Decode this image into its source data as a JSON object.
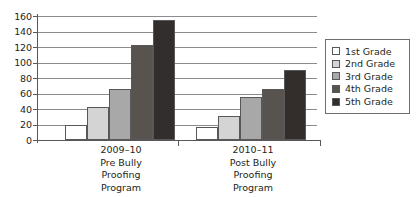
{
  "chart_data": {
    "type": "bar",
    "title": "",
    "subtitle": "",
    "xlabel": "",
    "ylabel": "",
    "ylim": [
      0,
      160
    ],
    "ytick_labels": [
      "160",
      "140",
      "120",
      "100",
      "80",
      "60",
      "40",
      "20",
      "0"
    ],
    "ytick_values": [
      160,
      140,
      120,
      100,
      80,
      60,
      40,
      20,
      0
    ],
    "grid": true,
    "legend_position": "right",
    "categories": [
      "2009–10 Pre Bully Proofing Program",
      "2010–11 Post Bully Proofing Program"
    ],
    "category_label_lines": [
      [
        "2009–10",
        "Pre Bully",
        "Proofing",
        "Program"
      ],
      [
        "2010–11",
        "Post Bully",
        "Proofing",
        "Program"
      ]
    ],
    "series": [
      {
        "name": "1st Grade",
        "color": "#ffffff",
        "values": [
          20,
          17
        ]
      },
      {
        "name": "2nd Grade",
        "color": "#d4d4d4",
        "values": [
          42,
          31
        ]
      },
      {
        "name": "3rd Grade",
        "color": "#a8a8a8",
        "values": [
          66,
          55
        ]
      },
      {
        "name": "4th Grade",
        "color": "#59534f",
        "values": [
          122,
          66
        ]
      },
      {
        "name": "5th Grade",
        "color": "#332e2b",
        "values": [
          155,
          90
        ]
      }
    ]
  },
  "legend": {
    "items": [
      {
        "label": "1st Grade"
      },
      {
        "label": "2nd Grade"
      },
      {
        "label": "3rd Grade"
      },
      {
        "label": "4th Grade"
      },
      {
        "label": "5th Grade"
      }
    ]
  },
  "colors": {
    "axis": "#58585a",
    "gridline": "#8b8b8b",
    "legend_border": "#6d6e71",
    "text": "#231f20"
  }
}
